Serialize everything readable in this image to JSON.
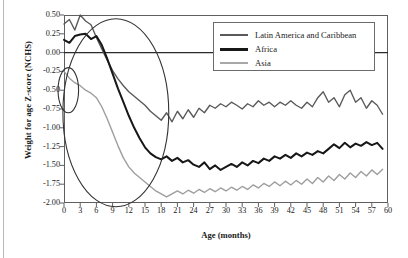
{
  "chart_data": {
    "type": "line",
    "title": "",
    "xlabel": "Age (months)",
    "ylabel": "Weight for age Z-score (NCHS)",
    "xlim": [
      0,
      60
    ],
    "ylim": [
      -2.0,
      0.5
    ],
    "xticks": [
      0,
      3,
      6,
      9,
      12,
      15,
      18,
      21,
      24,
      27,
      30,
      33,
      36,
      39,
      42,
      45,
      48,
      51,
      54,
      57,
      60
    ],
    "yticks": [
      0.5,
      0.25,
      0.0,
      -0.25,
      -0.5,
      -0.75,
      -1.0,
      -1.25,
      -1.5,
      -1.75,
      -2.0
    ],
    "grid": false,
    "legend_position": "top-right",
    "x": [
      0,
      1,
      2,
      3,
      4,
      5,
      6,
      7,
      8,
      9,
      10,
      11,
      12,
      13,
      14,
      15,
      16,
      17,
      18,
      19,
      20,
      21,
      22,
      23,
      24,
      25,
      26,
      27,
      28,
      29,
      30,
      31,
      32,
      33,
      34,
      35,
      36,
      37,
      38,
      39,
      40,
      41,
      42,
      43,
      44,
      45,
      46,
      47,
      48,
      49,
      50,
      51,
      52,
      53,
      54,
      55,
      56,
      57,
      58,
      59
    ],
    "series": [
      {
        "name": "Latin America and Caribbean",
        "color": "#5a5a5a",
        "width": 1.4,
        "values": [
          0.38,
          0.44,
          0.3,
          0.5,
          0.42,
          0.37,
          0.2,
          0.05,
          -0.1,
          -0.24,
          -0.35,
          -0.44,
          -0.52,
          -0.58,
          -0.64,
          -0.7,
          -0.78,
          -0.84,
          -0.9,
          -0.8,
          -0.92,
          -0.78,
          -0.88,
          -0.76,
          -0.86,
          -0.74,
          -0.8,
          -0.7,
          -0.74,
          -0.68,
          -0.72,
          -0.66,
          -0.7,
          -0.75,
          -0.68,
          -0.72,
          -0.64,
          -0.7,
          -0.66,
          -0.72,
          -0.66,
          -0.7,
          -0.64,
          -0.7,
          -0.74,
          -0.66,
          -0.72,
          -0.6,
          -0.52,
          -0.66,
          -0.6,
          -0.72,
          -0.56,
          -0.5,
          -0.66,
          -0.6,
          -0.74,
          -0.64,
          -0.7,
          -0.82
        ]
      },
      {
        "name": "Africa",
        "color": "#171717",
        "width": 2.0,
        "values": [
          0.17,
          0.13,
          0.22,
          0.24,
          0.25,
          0.18,
          0.22,
          0.1,
          -0.08,
          -0.28,
          -0.48,
          -0.66,
          -0.84,
          -1.0,
          -1.14,
          -1.26,
          -1.34,
          -1.39,
          -1.42,
          -1.38,
          -1.44,
          -1.4,
          -1.46,
          -1.43,
          -1.49,
          -1.52,
          -1.46,
          -1.55,
          -1.5,
          -1.56,
          -1.52,
          -1.48,
          -1.52,
          -1.46,
          -1.5,
          -1.44,
          -1.47,
          -1.41,
          -1.44,
          -1.38,
          -1.41,
          -1.36,
          -1.4,
          -1.34,
          -1.38,
          -1.33,
          -1.36,
          -1.31,
          -1.34,
          -1.28,
          -1.22,
          -1.27,
          -1.2,
          -1.26,
          -1.21,
          -1.24,
          -1.19,
          -1.23,
          -1.2,
          -1.28
        ]
      },
      {
        "name": "Asia",
        "color": "#9e9e9e",
        "width": 1.4,
        "values": [
          -0.25,
          -0.34,
          -0.4,
          -0.44,
          -0.5,
          -0.54,
          -0.6,
          -0.72,
          -0.88,
          -1.06,
          -1.24,
          -1.4,
          -1.52,
          -1.6,
          -1.66,
          -1.72,
          -1.78,
          -1.84,
          -1.88,
          -1.92,
          -1.88,
          -1.84,
          -1.88,
          -1.83,
          -1.87,
          -1.82,
          -1.86,
          -1.81,
          -1.85,
          -1.8,
          -1.84,
          -1.79,
          -1.83,
          -1.78,
          -1.82,
          -1.76,
          -1.8,
          -1.74,
          -1.78,
          -1.72,
          -1.77,
          -1.71,
          -1.76,
          -1.7,
          -1.75,
          -1.68,
          -1.74,
          -1.66,
          -1.72,
          -1.64,
          -1.7,
          -1.62,
          -1.68,
          -1.6,
          -1.66,
          -1.58,
          -1.64,
          -1.56,
          -1.62,
          -1.55
        ]
      }
    ],
    "annotations": [
      {
        "name": "small-ellipse",
        "shape": "ellipse",
        "cx": 0.8,
        "cy": -0.5,
        "rx": 1.9,
        "ry": 0.3,
        "color": "#333333"
      },
      {
        "name": "large-ellipse",
        "shape": "ellipse",
        "cx": 9.6,
        "cy": -0.8,
        "rx": 9.8,
        "ry": 1.25,
        "color": "#333333"
      }
    ]
  },
  "axes": {
    "y_title": "Weight for age Z-score (NCHS)",
    "x_title": "Age (months)",
    "y_tick_labels": [
      "0.50",
      "0.25",
      "0.00",
      "-0.25",
      "-0.50",
      "-0.75",
      "-1.00",
      "-1.25",
      "-1.50",
      "-1.75",
      "-2.00"
    ],
    "x_tick_labels": [
      "0",
      "3",
      "6",
      "9",
      "12",
      "15",
      "18",
      "21",
      "24",
      "27",
      "30",
      "33",
      "36",
      "39",
      "42",
      "45",
      "48",
      "51",
      "54",
      "57",
      "60"
    ]
  },
  "legend": {
    "items": [
      {
        "label": "Latin America and Caribbean",
        "color": "#5a5a5a",
        "width": 2.0
      },
      {
        "label": "Africa",
        "color": "#171717",
        "width": 3.0
      },
      {
        "label": "Asia",
        "color": "#a8a8a8",
        "width": 2.0
      }
    ]
  }
}
